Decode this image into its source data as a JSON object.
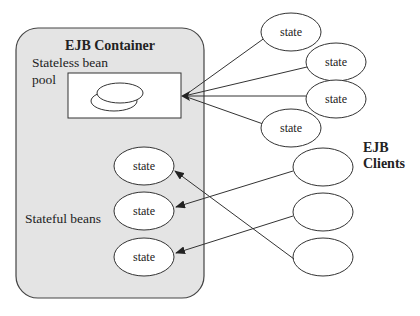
{
  "colors": {
    "container_fill": "#e4e4e4",
    "stroke": "#333333",
    "ellipse_fill": "#ffffff",
    "background": "#ffffff"
  },
  "container": {
    "title": "EJB Container",
    "stateless_label_line1": "Stateless bean",
    "stateless_label_line2": "pool",
    "stateful_label": "Stateful beans",
    "stateful_beans": [
      {
        "label": "state"
      },
      {
        "label": "state"
      },
      {
        "label": "state"
      }
    ]
  },
  "stateless_states": [
    {
      "label": "state"
    },
    {
      "label": "state"
    },
    {
      "label": "state"
    },
    {
      "label": "state"
    }
  ],
  "clients": {
    "title_line1": "EJB",
    "title_line2": "Clients",
    "items": [
      {
        "label": ""
      },
      {
        "label": ""
      },
      {
        "label": ""
      }
    ]
  }
}
